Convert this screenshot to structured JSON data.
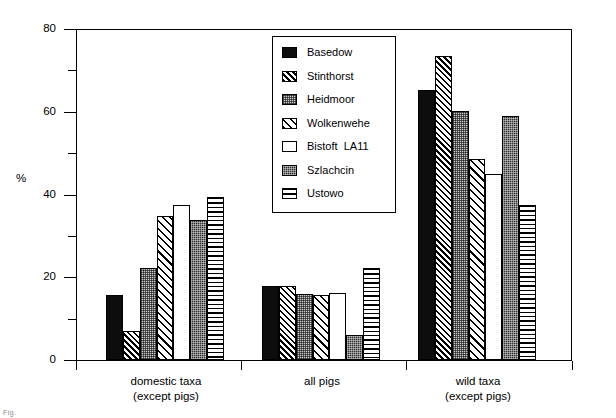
{
  "chart_data": {
    "type": "bar",
    "title": "",
    "xlabel": "",
    "ylabel": "%",
    "ylim": [
      0,
      80
    ],
    "yticks": [
      0,
      20,
      40,
      60,
      80
    ],
    "yticks_minor": [
      10,
      30,
      50,
      70
    ],
    "grid": false,
    "legend_position": "upper center",
    "categories": [
      "domestic taxa\n(except pigs)",
      "all pigs",
      "wild taxa\n(except pigs)"
    ],
    "category_lines": [
      [
        "domestic taxa",
        "(except pigs)"
      ],
      [
        "all pigs",
        ""
      ],
      [
        "wild taxa",
        "(except pigs)"
      ]
    ],
    "series": [
      {
        "name": "Basedow",
        "pattern": "solid",
        "values": [
          15.8,
          17.8,
          65.3
        ]
      },
      {
        "name": "Stinthorst",
        "pattern": "diag-fine",
        "values": [
          7.0,
          18.0,
          73.5
        ]
      },
      {
        "name": "Heidmoor",
        "pattern": "dot-light",
        "values": [
          22.2,
          16.0,
          60.2
        ]
      },
      {
        "name": "Wolkenwehe",
        "pattern": "diag-wide",
        "values": [
          34.7,
          15.8,
          48.7
        ]
      },
      {
        "name": "Bistoft  LA11",
        "pattern": "white",
        "values": [
          37.5,
          16.2,
          45.0
        ]
      },
      {
        "name": "Szlachcin",
        "pattern": "dot-dark",
        "values": [
          33.8,
          6.0,
          59.0
        ]
      },
      {
        "name": "Ustowo",
        "pattern": "horiz",
        "values": [
          39.3,
          22.3,
          37.5
        ]
      }
    ]
  },
  "axis": {
    "y_title": "%",
    "y_tick_labels": [
      "80",
      "60",
      "40",
      "20",
      "0"
    ]
  },
  "legend": {
    "items": [
      "Basedow",
      "Stinthorst",
      "Heidmoor",
      "Wolkenwehe",
      "Bistoft  LA11",
      "Szlachcin",
      "Ustowo"
    ]
  },
  "caption": {
    "fragment": "Fig."
  }
}
